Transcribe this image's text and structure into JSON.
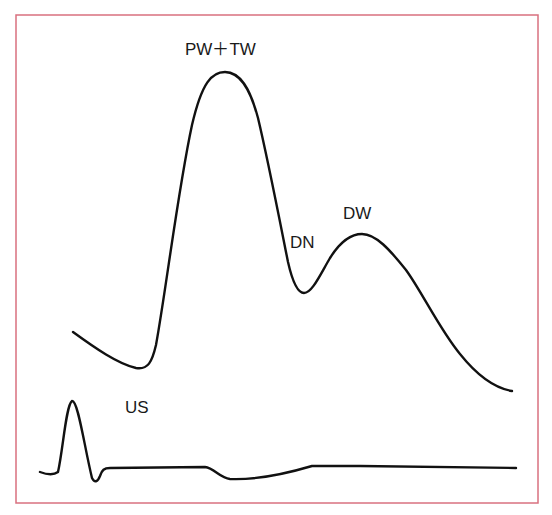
{
  "diagram": {
    "colors": {
      "frame": "#d9707f",
      "trace": "#111111",
      "label": "#1a1a1a",
      "background": "#ffffff"
    },
    "labels": {
      "peak": "PW＋TW",
      "notch": "DN",
      "second_peak": "DW",
      "ultrasound": "US"
    },
    "traces": [
      {
        "name": "pulse-waveform",
        "description": "Main pulse wave with primary peak (PW+TW), dicrotic notch (DN) and dicrotic wave (DW)"
      },
      {
        "name": "ultrasound-reference",
        "description": "Lower reference trace with initial spike (US)"
      }
    ]
  }
}
